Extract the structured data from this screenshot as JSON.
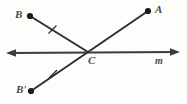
{
  "figure": {
    "name": "reflection-over-line-m-diagram",
    "type": "geometry-diagram",
    "background_color": "#fdfdfc",
    "stroke_color": "#3c3c3c",
    "label_color": "#4a4a4a"
  },
  "labels": {
    "point_a": "A",
    "point_b": "B",
    "point_c": "C",
    "point_b_prime": "B'",
    "line_m": "m"
  },
  "points": {
    "A": {
      "x": 148,
      "y": 11
    },
    "B": {
      "x": 30,
      "y": 16
    },
    "C": {
      "x": 88,
      "y": 52
    },
    "B_prime": {
      "x": 31,
      "y": 91
    }
  },
  "segments": [
    {
      "name": "segment-BC",
      "from": "B",
      "to": "C",
      "tick_marks": 1,
      "tick_at": {
        "x": 52,
        "y": 30
      }
    },
    {
      "name": "segment-B-prime-C",
      "from": "B_prime",
      "to": "C",
      "tick_marks": 1,
      "tick_at": {
        "x": 53,
        "y": 74
      }
    },
    {
      "name": "segment-CA",
      "from": "C",
      "to": "A",
      "tick_marks": 0
    }
  ],
  "lines": [
    {
      "name": "line-m",
      "label": "m",
      "arrow_start": {
        "x": 8,
        "y": 53
      },
      "arrow_end": {
        "x": 177,
        "y": 52
      },
      "double_headed": true
    }
  ]
}
